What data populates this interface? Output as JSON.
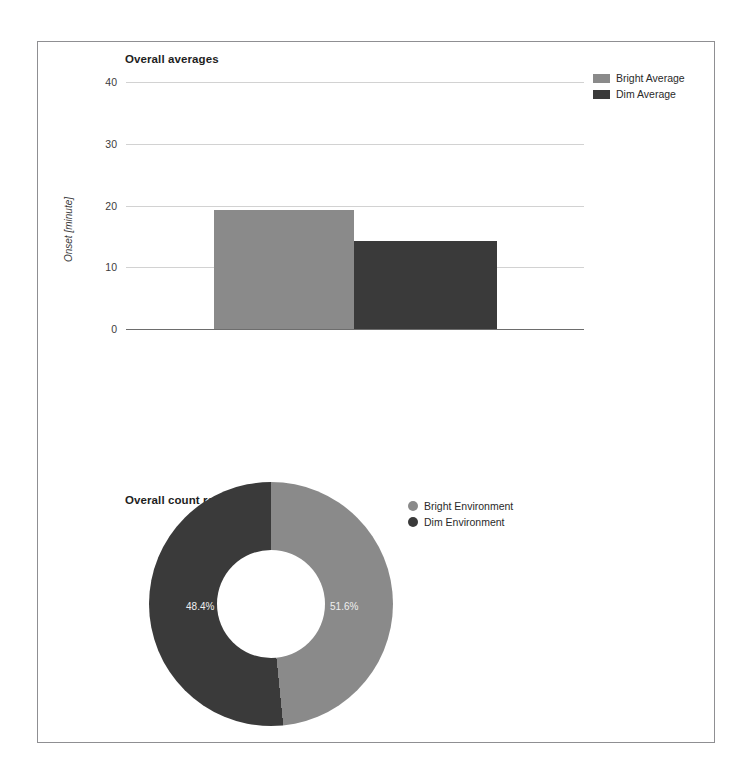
{
  "page": {
    "background": "#ffffff",
    "frame_border_color": "#8f8f92"
  },
  "colors": {
    "bright": "#8a8a8a",
    "dim": "#3a3a3a",
    "gridline": "#d2d2d2",
    "axis": "#6d6d6d",
    "slice_label": "#efefef"
  },
  "bar_section": {
    "title": "Overall averages",
    "y_axis_title": "Onset [minute]",
    "legend": [
      {
        "label": "Bright Average",
        "color": "#8a8a8a",
        "marker": "rect"
      },
      {
        "label": "Dim Average",
        "color": "#3a3a3a",
        "marker": "rect"
      }
    ]
  },
  "donut_section": {
    "title": "Overall count ratio",
    "legend": [
      {
        "label": "Bright Environment",
        "color": "#8a8a8a",
        "marker": "dot"
      },
      {
        "label": "Dim Environment",
        "color": "#3a3a3a",
        "marker": "dot"
      }
    ],
    "slice_labels": {
      "bright": "48.4%",
      "dim": "51.6%"
    }
  },
  "chart_data": [
    {
      "type": "bar",
      "title": "Overall averages",
      "xlabel": "",
      "ylabel": "Onset [minute]",
      "categories": [
        "Bright Average",
        "Dim Average"
      ],
      "values": [
        19.2,
        14.2
      ],
      "series": [
        {
          "name": "Bright Average",
          "values": [
            19.2
          ],
          "color": "#8a8a8a"
        },
        {
          "name": "Dim Average",
          "values": [
            14.2
          ],
          "color": "#3a3a3a"
        }
      ],
      "ylim": [
        0,
        40
      ],
      "yticks": [
        0,
        10,
        20,
        30,
        40
      ],
      "ytick_labels": [
        "0",
        "10",
        "20",
        "30",
        "40"
      ],
      "grid": true,
      "legend_position": "top-right"
    },
    {
      "type": "pie",
      "variant": "donut",
      "title": "Overall count ratio",
      "labels": [
        "Bright Environment",
        "Dim Environment"
      ],
      "values": [
        48.4,
        51.6
      ],
      "value_labels": [
        "48.4%",
        "51.6%"
      ],
      "colors": [
        "#8a8a8a",
        "#3a3a3a"
      ],
      "hole_ratio": 0.44,
      "start_angle_deg": 0,
      "direction": "clockwise",
      "legend_position": "right"
    }
  ]
}
